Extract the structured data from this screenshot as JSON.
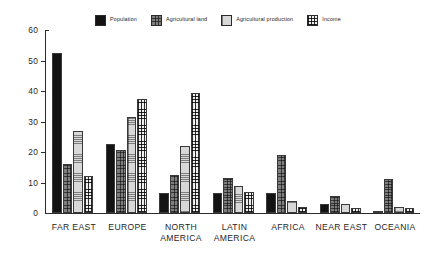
{
  "chart_data": {
    "type": "bar",
    "title": "",
    "xlabel": "",
    "ylabel": "",
    "ylim": [
      0,
      60
    ],
    "ytick_labels": [
      "60",
      "50",
      "40",
      "30",
      "20",
      "10",
      "0"
    ],
    "yticks": [
      60,
      50,
      40,
      30,
      20,
      10,
      0
    ],
    "grid": false,
    "legend_position": "top",
    "categories": [
      "FAR EAST",
      "EUROPE",
      "NORTH AMERICA",
      "LATIN AMERICA",
      "AFRICA",
      "NEAR EAST",
      "OCEANIA"
    ],
    "category_lines": [
      [
        "FAR EAST"
      ],
      [
        "EUROPE"
      ],
      [
        "NORTH",
        "AMERICA"
      ],
      [
        "LATIN",
        "AMERICA"
      ],
      [
        "AFRICA"
      ],
      [
        "NEAR EAST"
      ],
      [
        "OCEANIA"
      ]
    ],
    "series": [
      {
        "name": "Population",
        "fill": "solid-black",
        "color": "#131313",
        "values": [
          52.5,
          22.5,
          6.5,
          6.5,
          6.5,
          3.0,
          0.5
        ]
      },
      {
        "name": "Agricultural land",
        "fill": "dark-dotted",
        "color": "#7d7d7d",
        "values": [
          16.0,
          20.5,
          12.5,
          11.5,
          19.0,
          5.5,
          11.0
        ]
      },
      {
        "name": "Agricultural production",
        "fill": "light-dotted",
        "color": "#d8d8d8",
        "values": [
          27.0,
          31.5,
          22.0,
          9.0,
          4.0,
          3.0,
          2.0
        ]
      },
      {
        "name": "Income",
        "fill": "grid-hatch",
        "color": "#efefef",
        "values": [
          12.0,
          37.5,
          39.5,
          7.0,
          2.0,
          1.5,
          1.5
        ]
      }
    ]
  },
  "legend": {
    "items": [
      {
        "label": "Population",
        "swatch": "sw-population"
      },
      {
        "label": "Agricultural land",
        "swatch": "sw-agland"
      },
      {
        "label": "Agricultural production",
        "swatch": "sw-agprod"
      },
      {
        "label": "Income",
        "swatch": "sw-income"
      }
    ]
  }
}
